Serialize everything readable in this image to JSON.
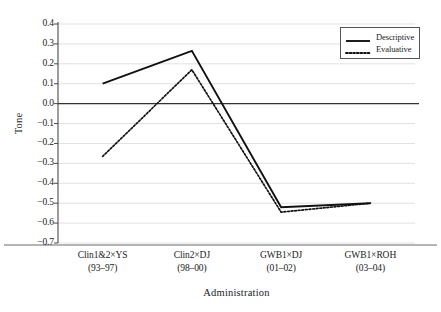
{
  "chart_data": {
    "type": "line",
    "title": "",
    "xlabel": "Administration",
    "ylabel": "Tone",
    "categories": [
      "Clin1&2×YS",
      "Clin2×DJ",
      "GWB1×DJ",
      "GWB1×ROH"
    ],
    "category_sublabels": [
      "(93–97)",
      "(98–00)",
      "(01–02)",
      "(03–04)"
    ],
    "series": [
      {
        "name": "Descriptive",
        "style": "solid",
        "values": [
          0.1,
          0.265,
          -0.52,
          -0.5
        ]
      },
      {
        "name": "Evaluative",
        "style": "dotted",
        "values": [
          -0.265,
          0.17,
          -0.545,
          -0.5
        ]
      }
    ],
    "ylim": [
      -0.7,
      0.4
    ],
    "ytick_labels": [
      "0.4",
      "0.3",
      "0.2",
      "0.1",
      "0.0",
      "−0.1",
      "−0.2",
      "−0.3",
      "−0.4",
      "−0.5",
      "−0.6",
      "−0.7"
    ],
    "ytick_values": [
      0.4,
      0.3,
      0.2,
      0.1,
      0.0,
      -0.1,
      -0.2,
      -0.3,
      -0.4,
      -0.5,
      -0.6,
      -0.7
    ],
    "grid": true,
    "grid_axis": "y",
    "legend_position": "top-right",
    "colors": {
      "line": "#111111",
      "grid": "#d9d9d9",
      "axis": "#4a4a4a",
      "zero_line": "#333333",
      "background": "#ffffff"
    }
  }
}
